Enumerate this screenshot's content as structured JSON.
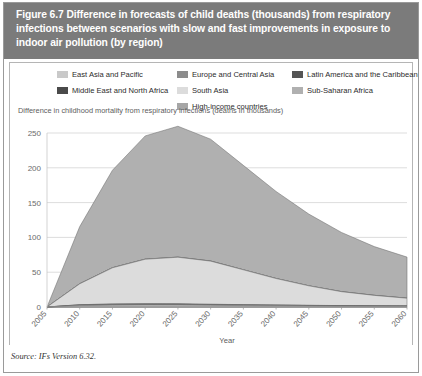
{
  "figure": {
    "title": "Figure 6.7 Difference in forecasts of child deaths (thousands) from respiratory infections between scenarios with slow and fast improvements in exposure to indoor air pollution (by region)",
    "source": "Source: IFs Version 6.32.",
    "header_bg": "#7b7b7b",
    "panel_bg": "#ffffff",
    "frame_color": "#9a9a9a"
  },
  "legend": {
    "columns": [
      {
        "x": 48,
        "items": [
          {
            "label": "East Asia and Pacific",
            "color": "#c9c9c9"
          },
          {
            "label": "Middle East and North Africa",
            "color": "#4a4a4a"
          }
        ]
      },
      {
        "x": 168,
        "items": [
          {
            "label": "Europe and Central Asia",
            "color": "#8c8c8c"
          },
          {
            "label": "South Asia",
            "color": "#dcdcdc"
          },
          {
            "label": "High-income countries",
            "color": "#a6a6a6"
          }
        ]
      },
      {
        "x": 283,
        "items": [
          {
            "label": "Latin America and the Caribbean",
            "color": "#555555"
          },
          {
            "label": "Sub-Saharan Africa",
            "color": "#b0b0b0"
          }
        ]
      }
    ]
  },
  "chart_data": {
    "type": "area",
    "stacked": true,
    "title": "Figure 6.7 Difference in forecasts of child deaths (thousands) from respiratory infections between scenarios with slow and fast improvements in exposure to indoor air pollution (by region)",
    "xlabel": "Year",
    "ylabel": "Difference in childhood mortality from respiratory infections (deaths in thousands)",
    "xlim": [
      2005,
      2060
    ],
    "ylim": [
      0,
      250
    ],
    "yticks": [
      0,
      50,
      100,
      150,
      200,
      250
    ],
    "xticks": [
      2005,
      2010,
      2015,
      2020,
      2025,
      2030,
      2035,
      2040,
      2045,
      2050,
      2055,
      2060
    ],
    "grid": "horizontal",
    "legend_position": "top",
    "x": [
      2005,
      2010,
      2015,
      2020,
      2025,
      2030,
      2035,
      2040,
      2045,
      2050,
      2055,
      2060
    ],
    "series": [
      {
        "name": "East Asia and Pacific",
        "color": "#c9c9c9",
        "values": [
          0,
          2.0,
          2.6,
          2.8,
          2.7,
          2.4,
          2.0,
          1.7,
          1.4,
          1.2,
          1.0,
          0.9
        ]
      },
      {
        "name": "Europe and Central Asia",
        "color": "#8c8c8c",
        "values": [
          0,
          0.4,
          0.5,
          0.5,
          0.5,
          0.4,
          0.4,
          0.3,
          0.3,
          0.2,
          0.2,
          0.2
        ]
      },
      {
        "name": "Latin America and the Caribbean",
        "color": "#555555",
        "values": [
          0,
          0.5,
          0.7,
          0.7,
          0.7,
          0.6,
          0.5,
          0.5,
          0.4,
          0.3,
          0.3,
          0.3
        ]
      },
      {
        "name": "Middle East and North Africa",
        "color": "#4a4a4a",
        "values": [
          0,
          0.4,
          0.5,
          0.6,
          0.6,
          0.5,
          0.5,
          0.4,
          0.3,
          0.3,
          0.2,
          0.2
        ]
      },
      {
        "name": "South Asia",
        "color": "#dcdcdc",
        "values": [
          0,
          30,
          52,
          64,
          67,
          62,
          50,
          38,
          28,
          20,
          15,
          11
        ]
      },
      {
        "name": "High-income countries",
        "color": "#a6a6a6",
        "values": [
          0,
          0.2,
          0.2,
          0.2,
          0.2,
          0.2,
          0.1,
          0.1,
          0.1,
          0.1,
          0.1,
          0.1
        ]
      },
      {
        "name": "Sub-Saharan Africa",
        "color": "#b0b0b0",
        "values": [
          0,
          82,
          140,
          177,
          188,
          175,
          150,
          125,
          103,
          85,
          70,
          59
        ]
      }
    ],
    "totals": [
      0,
      115.5,
      196.5,
      225.8,
      234.7,
      215.1,
      188.5,
      161.0,
      133.5,
      107.1,
      86.8,
      71.7
    ],
    "annotations": []
  }
}
